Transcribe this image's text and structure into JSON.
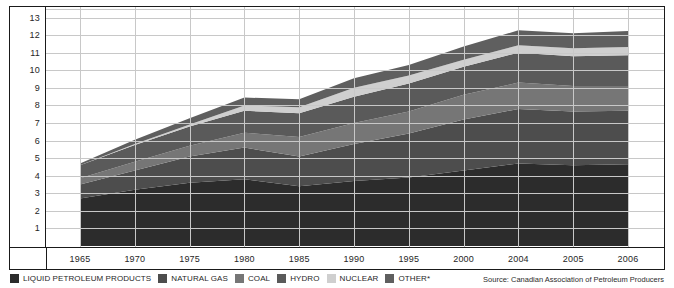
{
  "chart_data": {
    "type": "area",
    "stacked": true,
    "title": "",
    "subtitle": "",
    "xlabel": "",
    "ylabel": "",
    "grid": true,
    "legend_position": "bottom-left",
    "ylim": [
      0,
      13.6
    ],
    "yticks": [
      1,
      2,
      3,
      4,
      5,
      6,
      7,
      8,
      9,
      10,
      11,
      12,
      13
    ],
    "categories": [
      "1965",
      "1970",
      "1975",
      "1980",
      "1985",
      "1990",
      "1995",
      "2000",
      "2004",
      "2005",
      "2006"
    ],
    "series": [
      {
        "name": "LIQUID PETROLEUM PRODUCTS",
        "color": "#2c2c2c",
        "values": [
          2.7,
          3.2,
          3.6,
          3.8,
          3.4,
          3.7,
          3.9,
          4.3,
          4.7,
          4.6,
          4.65
        ]
      },
      {
        "name": "NATURAL GAS",
        "color": "#4d4d4d",
        "values": [
          0.8,
          1.1,
          1.5,
          1.8,
          1.7,
          2.1,
          2.5,
          2.9,
          3.1,
          3.05,
          3.05
        ]
      },
      {
        "name": "COAL",
        "color": "#767676",
        "values": [
          0.35,
          0.5,
          0.6,
          0.85,
          1.1,
          1.2,
          1.25,
          1.4,
          1.5,
          1.45,
          1.4
        ]
      },
      {
        "name": "HYDRO",
        "color": "#5a5a5a",
        "values": [
          0.75,
          0.95,
          1.1,
          1.25,
          1.35,
          1.5,
          1.6,
          1.6,
          1.7,
          1.7,
          1.75
        ]
      },
      {
        "name": "NUCLEAR",
        "color": "#cfcfcf",
        "values": [
          0.0,
          0.05,
          0.12,
          0.3,
          0.35,
          0.5,
          0.45,
          0.4,
          0.42,
          0.45,
          0.48
        ]
      },
      {
        "name": "OTHER*",
        "color": "#5f5f5f",
        "values": [
          0.1,
          0.25,
          0.35,
          0.45,
          0.45,
          0.55,
          0.6,
          0.75,
          0.85,
          0.85,
          0.9
        ]
      }
    ],
    "totals": [
      4.7,
      6.05,
      7.27,
      8.45,
      8.35,
      9.55,
      10.3,
      11.35,
      12.27,
      12.1,
      12.23
    ],
    "source_note": "Source: Canadian Association of Petroleum Producers"
  },
  "legend": {
    "items": [
      {
        "label": "LIQUID PETROLEUM PRODUCTS",
        "color": "#2c2c2c"
      },
      {
        "label": "NATURAL GAS",
        "color": "#4d4d4d"
      },
      {
        "label": "COAL",
        "color": "#767676"
      },
      {
        "label": "HYDRO",
        "color": "#5a5a5a"
      },
      {
        "label": "NUCLEAR",
        "color": "#cfcfcf"
      },
      {
        "label": "OTHER*",
        "color": "#5f5f5f"
      }
    ]
  },
  "footer": {
    "source": "Source: Canadian Association of Petroleum Producers"
  },
  "colors": {
    "frame": "#1a1a1a",
    "grid": "#c8c8c8",
    "background": "#ffffff",
    "text": "#262626"
  }
}
